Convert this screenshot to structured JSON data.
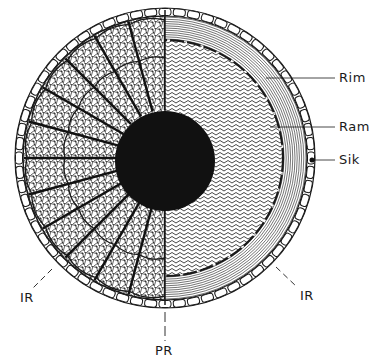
{
  "diagram": {
    "type": "cross-section schematic",
    "geometry": {
      "center": [
        165,
        158
      ],
      "outer_radius": 150,
      "core_radius": 50,
      "ram_boundary_radius": 118,
      "divider_x": 165
    },
    "halves": {
      "left": "radial segments with reticulate cell pattern",
      "right": "zigzag ramus zone and concentric rim lines"
    },
    "labels": {
      "rim": "Rim",
      "ram": "Ram",
      "sik": "Sik",
      "ir_left": "IR",
      "ir_right": "IR",
      "pr": "PR"
    },
    "colors": {
      "ink": "#1a1a1a",
      "background": "#ffffff"
    }
  }
}
